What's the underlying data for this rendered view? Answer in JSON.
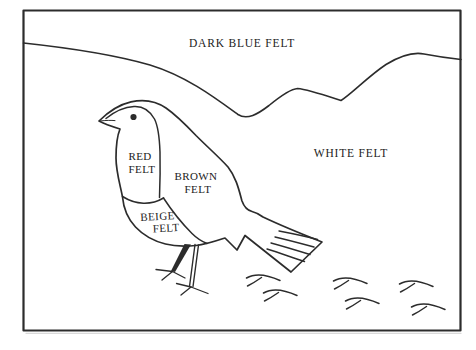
{
  "diagram": {
    "region_labels": {
      "sky": "DARK BLUE FELT",
      "snow": "WHITE FELT"
    },
    "bird_part_labels": {
      "breast": {
        "word1": "RED",
        "word2": "FELT"
      },
      "body": {
        "word1": "BROWN",
        "word2": "FELT"
      },
      "belly": {
        "word1": "BEIGE",
        "word2": "FELT"
      }
    },
    "colors": {
      "ink": "#2c2c2c",
      "label_text": "#222222",
      "paper": "#ffffff"
    }
  }
}
